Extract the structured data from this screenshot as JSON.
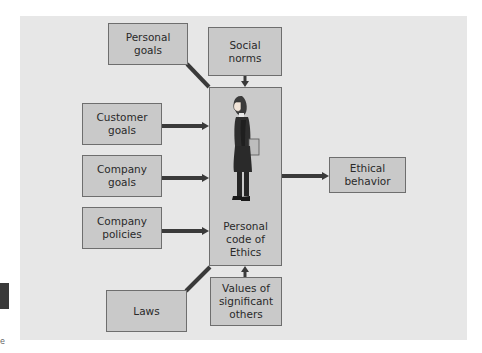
{
  "diagram": {
    "center": {
      "label": "Personal\ncode of\nEthics",
      "figure": "woman-figure"
    },
    "inputs": [
      {
        "id": "personal-goals",
        "label": "Personal\ngoals"
      },
      {
        "id": "social-norms",
        "label": "Social\nnorms"
      },
      {
        "id": "customer-goals",
        "label": "Customer\ngoals"
      },
      {
        "id": "company-goals",
        "label": "Company\ngoals"
      },
      {
        "id": "company-policies",
        "label": "Company\npolicies"
      },
      {
        "id": "laws",
        "label": "Laws"
      },
      {
        "id": "values-of-significant-others",
        "label": "Values of\nsignificant\nothers"
      }
    ],
    "output": {
      "id": "ethical-behavior",
      "label": "Ethical\nbehavior"
    },
    "colors": {
      "panel": "#e7e7e7",
      "box": "#c9c9c9",
      "border": "#6e6e6e",
      "arrow": "#3a3a3a"
    }
  },
  "edge": {
    "text": "e"
  }
}
